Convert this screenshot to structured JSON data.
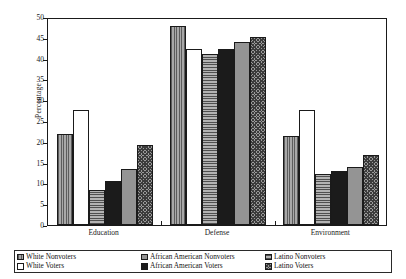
{
  "chart_data": {
    "type": "bar",
    "title": "",
    "xlabel": "",
    "ylabel": "Percentage",
    "ylim": [
      0,
      50
    ],
    "yticks": [
      0,
      5,
      10,
      15,
      20,
      25,
      30,
      35,
      40,
      45,
      50
    ],
    "grid": false,
    "legend_position": "bottom",
    "categories": [
      "Education",
      "Defense",
      "Environment"
    ],
    "series": [
      {
        "name": "White Nonvoters",
        "pattern": "vertical-stripes",
        "values": [
          21.8,
          47.8,
          21.3
        ]
      },
      {
        "name": "White Voters",
        "pattern": "white-empty",
        "values": [
          27.7,
          42.3,
          27.7
        ]
      },
      {
        "name": "African American Nonvoters",
        "pattern": "horizontal-stripes",
        "values": [
          8.5,
          41.2,
          12.2
        ]
      },
      {
        "name": "African American Voters",
        "pattern": "solid-black",
        "values": [
          10.5,
          42.2,
          13.0
        ]
      },
      {
        "name": "Latino Nonvoters",
        "pattern": "solid-gray",
        "values": [
          13.4,
          44.0,
          14.0
        ]
      },
      {
        "name": "Latino Voters",
        "pattern": "checkered",
        "values": [
          19.2,
          45.2,
          16.8
        ]
      }
    ]
  },
  "legend": {
    "entries": [
      {
        "label": "White Nonvoters",
        "swatch": "vertical-stripes"
      },
      {
        "label": "White Voters",
        "swatch": "white-empty"
      },
      {
        "label": "African American Nonvoters",
        "swatch": "solid-gray"
      },
      {
        "label": "African American Voters",
        "swatch": "solid-black"
      },
      {
        "label": "Latino Nonvoters",
        "swatch": "horizontal-stripes"
      },
      {
        "label": "Latino Voters",
        "swatch": "checkered"
      }
    ]
  },
  "colors": {
    "axis": "#1a1a1a",
    "background": "#ffffff",
    "bar_gray": "#949494",
    "bar_black": "#1b1b1b"
  }
}
